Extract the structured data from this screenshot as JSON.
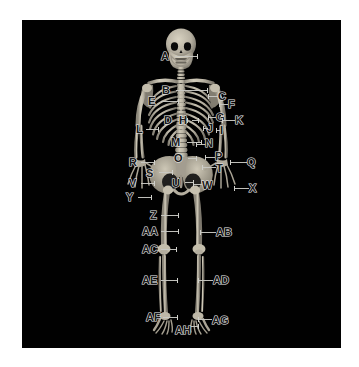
{
  "figure": {
    "kind": "labeled-anatomical-diagram",
    "background_color": "#010101",
    "page_color": "#ffffff",
    "bone_color": "#b9b3a4",
    "label_text_color": "#1a1a1a",
    "label_outline_color": "#e9e9e9",
    "leader_line_color": "#c9c9c4"
  },
  "labels": [
    {
      "id": "A",
      "text": "A",
      "x": 139,
      "y": 31,
      "line": {
        "x": 153,
        "y": 36,
        "w": 22,
        "dir": "right"
      }
    },
    {
      "id": "B",
      "text": "B",
      "x": 140,
      "y": 65,
      "line": {
        "x": 154,
        "y": 70,
        "w": 31,
        "dir": "right"
      }
    },
    {
      "id": "C",
      "text": "C",
      "x": 196,
      "y": 71,
      "line": {
        "x": 186,
        "y": 76,
        "w": 10,
        "dir": "left"
      }
    },
    {
      "id": "D",
      "text": "D",
      "x": 142,
      "y": 95,
      "line": {
        "x": 156,
        "y": 100,
        "w": 9,
        "dir": "right"
      }
    },
    {
      "id": "E",
      "text": "E",
      "x": 126,
      "y": 76,
      "line": {
        "x": 139,
        "y": 81,
        "w": 17,
        "dir": "right"
      }
    },
    {
      "id": "F",
      "text": "F",
      "x": 206,
      "y": 79,
      "line": {
        "x": 197,
        "y": 84,
        "w": 9,
        "dir": "left"
      }
    },
    {
      "id": "G",
      "text": "G",
      "x": 194,
      "y": 92,
      "line": {
        "x": 186,
        "y": 97,
        "w": 8,
        "dir": "left"
      }
    },
    {
      "id": "H",
      "text": "H",
      "x": 157,
      "y": 95,
      "line": {
        "x": 170,
        "y": 100,
        "w": 6,
        "dir": "right"
      }
    },
    {
      "id": "I",
      "text": "I",
      "x": 198,
      "y": 105,
      "line": {
        "x": 194,
        "y": 110,
        "w": 5,
        "dir": "left"
      }
    },
    {
      "id": "J",
      "text": "J",
      "x": 185,
      "y": 103,
      "line": {
        "x": 181,
        "y": 108,
        "w": 5,
        "dir": "left"
      }
    },
    {
      "id": "K",
      "text": "K",
      "x": 213,
      "y": 95,
      "line": {
        "x": 200,
        "y": 100,
        "w": 13,
        "dir": "left"
      }
    },
    {
      "id": "L",
      "text": "L",
      "x": 114,
      "y": 104,
      "line": {
        "x": 124,
        "y": 109,
        "w": 12,
        "dir": "right"
      }
    },
    {
      "id": "M",
      "text": "M",
      "x": 149,
      "y": 117,
      "line": {
        "x": 165,
        "y": 122,
        "w": 14,
        "dir": "right"
      }
    },
    {
      "id": "N",
      "text": "N",
      "x": 183,
      "y": 118,
      "line": {
        "x": 174,
        "y": 124,
        "w": 10,
        "dir": "left"
      }
    },
    {
      "id": "O",
      "text": "O",
      "x": 152,
      "y": 133,
      "line": {
        "x": 166,
        "y": 138,
        "w": 8,
        "dir": "right"
      }
    },
    {
      "id": "P",
      "text": "P",
      "x": 193,
      "y": 131,
      "line": {
        "x": 183,
        "y": 137,
        "w": 10,
        "dir": "left"
      }
    },
    {
      "id": "Q",
      "text": "Q",
      "x": 225,
      "y": 137,
      "line": {
        "x": 208,
        "y": 142,
        "w": 17,
        "dir": "left"
      }
    },
    {
      "id": "R",
      "text": "R",
      "x": 107,
      "y": 137,
      "line": {
        "x": 119,
        "y": 142,
        "w": 13,
        "dir": "right"
      }
    },
    {
      "id": "S",
      "text": "S",
      "x": 124,
      "y": 148,
      "line": {
        "x": 137,
        "y": 152,
        "w": 13,
        "dir": "right"
      }
    },
    {
      "id": "T",
      "text": "T",
      "x": 194,
      "y": 143,
      "line": {
        "x": 180,
        "y": 147,
        "w": 14,
        "dir": "left"
      }
    },
    {
      "id": "U",
      "text": "U",
      "x": 150,
      "y": 158,
      "line": {
        "x": 163,
        "y": 162,
        "w": 8,
        "dir": "right"
      }
    },
    {
      "id": "V",
      "text": "V",
      "x": 107,
      "y": 158,
      "line": {
        "x": 119,
        "y": 163,
        "w": 13,
        "dir": "right"
      }
    },
    {
      "id": "W",
      "text": "W",
      "x": 180,
      "y": 160,
      "line": {
        "x": 171,
        "y": 164,
        "w": 9,
        "dir": "left"
      }
    },
    {
      "id": "X",
      "text": "X",
      "x": 227,
      "y": 163,
      "line": {
        "x": 212,
        "y": 168,
        "w": 15,
        "dir": "left"
      }
    },
    {
      "id": "Y",
      "text": "Y",
      "x": 104,
      "y": 172,
      "line": {
        "x": 116,
        "y": 177,
        "w": 13,
        "dir": "right"
      }
    },
    {
      "id": "Z",
      "text": "Z",
      "x": 128,
      "y": 190,
      "line": {
        "x": 139,
        "y": 195,
        "w": 17,
        "dir": "right"
      }
    },
    {
      "id": "AA",
      "text": "AA",
      "x": 120,
      "y": 206,
      "line": {
        "x": 139,
        "y": 211,
        "w": 17,
        "dir": "right"
      }
    },
    {
      "id": "AB",
      "text": "AB",
      "x": 194,
      "y": 207,
      "line": {
        "x": 178,
        "y": 212,
        "w": 16,
        "dir": "left"
      }
    },
    {
      "id": "AC",
      "text": "AC",
      "x": 120,
      "y": 224,
      "line": {
        "x": 139,
        "y": 229,
        "w": 15,
        "dir": "right"
      }
    },
    {
      "id": "AD",
      "text": "AD",
      "x": 191,
      "y": 255,
      "line": {
        "x": 176,
        "y": 260,
        "w": 15,
        "dir": "left"
      }
    },
    {
      "id": "AE",
      "text": "AE",
      "x": 120,
      "y": 255,
      "line": {
        "x": 139,
        "y": 260,
        "w": 16,
        "dir": "right"
      }
    },
    {
      "id": "AF",
      "text": "AF",
      "x": 124,
      "y": 292,
      "line": {
        "x": 141,
        "y": 297,
        "w": 14,
        "dir": "right"
      }
    },
    {
      "id": "AG",
      "text": "AG",
      "x": 190,
      "y": 295,
      "line": {
        "x": 176,
        "y": 299,
        "w": 14,
        "dir": "left"
      }
    },
    {
      "id": "AH",
      "text": "AH",
      "x": 153,
      "y": 305,
      "line": {
        "x": 168,
        "y": 306,
        "w": 8,
        "dir": "right"
      }
    }
  ]
}
